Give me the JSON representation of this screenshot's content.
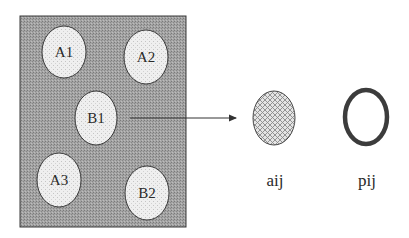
{
  "diagram": {
    "region": {
      "x": 20,
      "y": 16,
      "width": 166,
      "height": 211,
      "fill": "#9a9a9a",
      "stroke": "#3a3a3a"
    },
    "cells": [
      {
        "id": "A1",
        "label": "A1",
        "cx": 64,
        "cy": 52,
        "rx": 22,
        "ry": 26
      },
      {
        "id": "A2",
        "label": "A2",
        "cx": 146,
        "cy": 57,
        "rx": 22,
        "ry": 27
      },
      {
        "id": "B1",
        "label": "B1",
        "cx": 96,
        "cy": 118,
        "rx": 21,
        "ry": 27
      },
      {
        "id": "A3",
        "label": "A3",
        "cx": 59,
        "cy": 180,
        "rx": 22,
        "ry": 27
      },
      {
        "id": "B2",
        "label": "B2",
        "cx": 147,
        "cy": 193,
        "rx": 22,
        "ry": 27
      }
    ],
    "cell_fill": "#ececec",
    "cell_stroke": "#3a3a3a",
    "arrow": {
      "x1": 130,
      "y1": 118,
      "x2": 236,
      "y2": 118,
      "color": "#333333"
    },
    "outputs": [
      {
        "id": "aij",
        "label": "aij",
        "style": "hatched",
        "cx": 274,
        "cy": 118,
        "rx": 21,
        "ry": 27,
        "label_x": 275,
        "label_y": 186
      },
      {
        "id": "pij",
        "label": "pij",
        "style": "ring",
        "cx": 366,
        "cy": 117,
        "rx": 21,
        "ry": 27,
        "stroke_width": 4.5,
        "label_x": 367,
        "label_y": 186
      }
    ],
    "ring_color": "#3c3c3c"
  }
}
